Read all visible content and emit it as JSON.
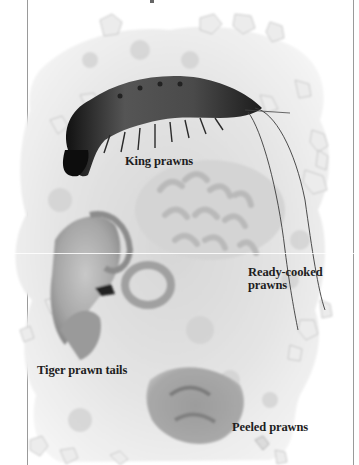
{
  "page": {
    "type": "book-illustration",
    "colors": {
      "background": "#ffffff",
      "ice": "#e6e6e6",
      "ice_shadow": "#b8b8b8",
      "king_prawn": "#3a3a3a",
      "cooked_prawn": "#cfcfcf",
      "label_text": "#1e1e1e",
      "rule": "#9a9a9a"
    }
  },
  "labels": {
    "king_prawns": "King prawns",
    "ready_cooked_line1": "Ready-cooked",
    "ready_cooked_line2": "prawns",
    "tiger_prawn_tails": "Tiger prawn tails",
    "peeled_prawns": "Peeled prawns"
  },
  "image": {
    "subject": "prawns on crushed ice",
    "items": [
      "king-prawn",
      "ready-cooked-prawns",
      "tiger-prawn-tails",
      "peeled-prawns"
    ]
  }
}
